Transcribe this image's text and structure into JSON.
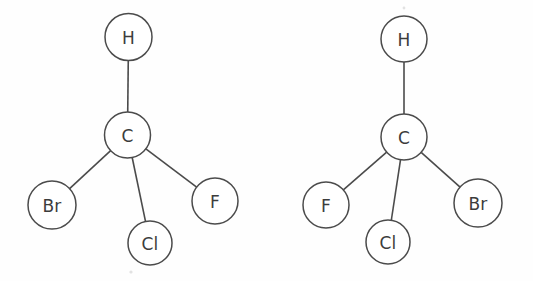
{
  "figure": {
    "background_color": "#fefefe",
    "stroke_color": "#4b4b4b",
    "label_color": "#3c3c3c",
    "fill_color": "#ffffff",
    "width": 533,
    "height": 281
  },
  "molecules": [
    {
      "id": "molecule-left",
      "name": "bromochlorofluoromethane-enantiomer-left",
      "atoms": [
        {
          "id": "atom-h-left",
          "label": "H",
          "cx": 128.5,
          "cy": 37,
          "r": 23.5
        },
        {
          "id": "atom-c-left",
          "label": "C",
          "cx": 127.5,
          "cy": 135,
          "r": 23.0
        },
        {
          "id": "atom-br-left",
          "label": "Br",
          "cx": 52.0,
          "cy": 205,
          "r": 24.0
        },
        {
          "id": "atom-cl-left",
          "label": "Cl",
          "cx": 150.0,
          "cy": 243,
          "r": 22.0
        },
        {
          "id": "atom-f-left",
          "label": "F",
          "cx": 215.0,
          "cy": 201,
          "r": 23.0
        }
      ],
      "bonds": [
        {
          "id": "bond-left-c-h",
          "from": "atom-c-left",
          "to": "atom-h-left"
        },
        {
          "id": "bond-left-c-br",
          "from": "atom-c-left",
          "to": "atom-br-left"
        },
        {
          "id": "bond-left-c-cl",
          "from": "atom-c-left",
          "to": "atom-cl-left"
        },
        {
          "id": "bond-left-c-f",
          "from": "atom-c-left",
          "to": "atom-f-left"
        }
      ]
    },
    {
      "id": "molecule-right",
      "name": "bromochlorofluoromethane-enantiomer-right",
      "atoms": [
        {
          "id": "atom-h-right",
          "label": "H",
          "cx": 404.0,
          "cy": 39,
          "r": 23.0
        },
        {
          "id": "atom-c-right",
          "label": "C",
          "cx": 404.0,
          "cy": 137,
          "r": 23.0
        },
        {
          "id": "atom-f-right",
          "label": "F",
          "cx": 326.0,
          "cy": 205,
          "r": 23.0
        },
        {
          "id": "atom-cl-right",
          "label": "Cl",
          "cx": 388.0,
          "cy": 242,
          "r": 22.0
        },
        {
          "id": "atom-br-right",
          "label": "Br",
          "cx": 478.0,
          "cy": 203,
          "r": 24.0
        }
      ],
      "bonds": [
        {
          "id": "bond-right-c-h",
          "from": "atom-c-right",
          "to": "atom-h-right"
        },
        {
          "id": "bond-right-c-f",
          "from": "atom-c-right",
          "to": "atom-f-right"
        },
        {
          "id": "bond-right-c-cl",
          "from": "atom-c-right",
          "to": "atom-cl-right"
        },
        {
          "id": "bond-right-c-br",
          "from": "atom-c-right",
          "to": "atom-br-right"
        }
      ]
    }
  ],
  "specks": [
    {
      "id": "speck-1",
      "cx": 131,
      "cy": 272,
      "r": 1.6
    },
    {
      "id": "speck-2",
      "cx": 404,
      "cy": 8,
      "r": 1.4
    }
  ]
}
